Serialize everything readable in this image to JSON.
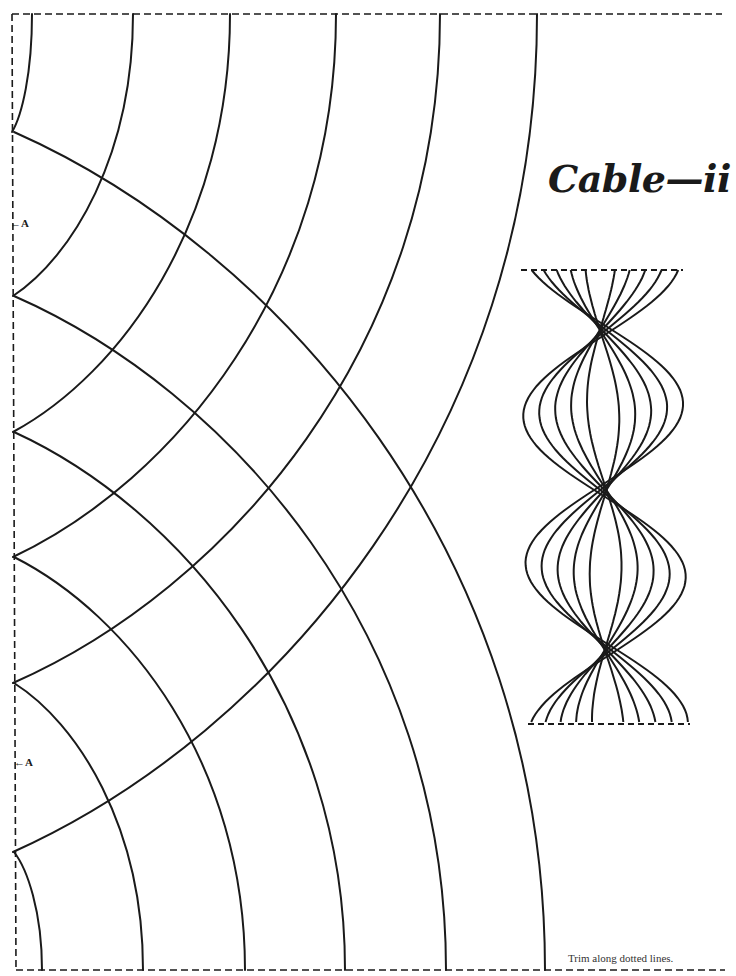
{
  "title": "Cable—ii",
  "trim_note": "Trim along dotted lines.",
  "markers": [
    {
      "label": "←A",
      "x": 10,
      "y": 217
    },
    {
      "label": "←A",
      "x": 14,
      "y": 756
    }
  ],
  "colors": {
    "ink": "#1a1a1a",
    "paper": "#ffffff"
  },
  "pattern": {
    "trim_border": {
      "left": 12,
      "top": 14,
      "right": 722,
      "bottom": 970,
      "left_line_bottom": 970
    },
    "top_edge_y": 14,
    "bottom_edge_y": 970,
    "left_edge_x": 12,
    "left_vertices_y": [
      132,
      296,
      432,
      557,
      683,
      852
    ],
    "top_arc_x": [
      32,
      133,
      230,
      336,
      440,
      537
    ],
    "bottom_arc_x": [
      42,
      143,
      245,
      345,
      446,
      545
    ]
  },
  "preview_cable": {
    "top": 270,
    "bottom": 724,
    "top_left": 521,
    "top_right": 683,
    "bottom_left": 528,
    "bottom_right": 690,
    "center_x": 604,
    "strand_offsets": [
      16,
      32,
      48,
      64,
      80
    ],
    "bulge_centers_y": [
      410,
      570
    ],
    "half_period": 160
  }
}
